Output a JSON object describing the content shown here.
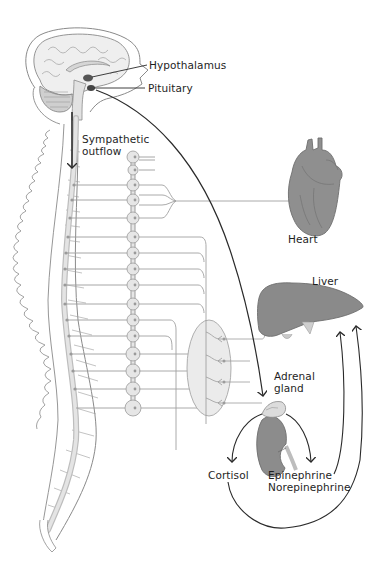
{
  "diagram": {
    "labels": {
      "hypothalamus": "Hypothalamus",
      "pituitary": "Pituitary",
      "sympathetic_line1": "Sympathetic",
      "sympathetic_line2": "outflow",
      "heart": "Heart",
      "liver": "Liver",
      "adrenal_line1": "Adrenal",
      "adrenal_line2": "gland",
      "cortisol": "Cortisol",
      "epinephrine": "Epinephrine",
      "norepinephrine": "Norepinephrine"
    },
    "structures": [
      "brain",
      "spinal-cord",
      "vertebral-column",
      "sympathetic-chain-ganglia",
      "celiac-ganglion-plexus",
      "heart",
      "liver",
      "kidney",
      "adrenal-gland"
    ],
    "colors": {
      "line_dark": "#2a2a2a",
      "nerve_gray": "#9a9a9a",
      "organ_gray": "#8e8e8e",
      "ganglion_fill": "#e6e6e6",
      "outline": "#8a8a8a"
    }
  }
}
